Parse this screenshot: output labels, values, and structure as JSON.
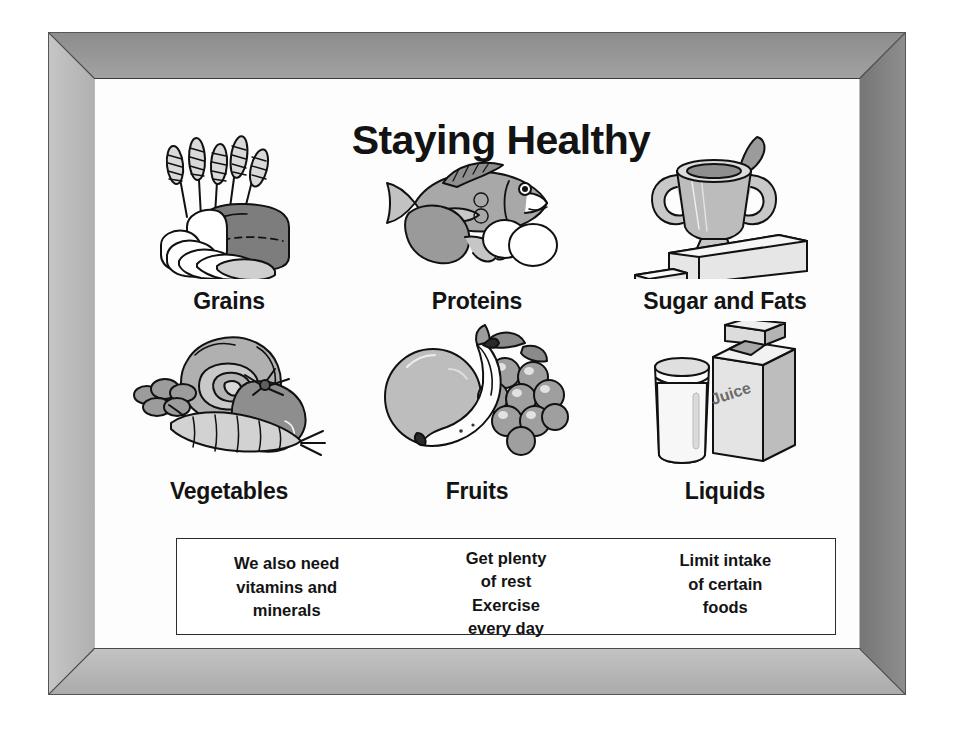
{
  "poster": {
    "title": "Staying Healthy",
    "frame_colors": {
      "frame_base": "#b9b9b9",
      "bevel_top": "#8c8c8c",
      "bevel_left": "#c6c6c6",
      "bevel_right": "#767676",
      "bevel_bottom": "#c3c3c3",
      "canvas": "#fdfdfd",
      "ink": "#131313"
    }
  },
  "food_groups": [
    {
      "id": "grains",
      "label": "Grains",
      "icon": "grains-bread-wheat-illustration",
      "items": [
        "wheat stalks",
        "loaf of bread",
        "bread slices"
      ]
    },
    {
      "id": "proteins",
      "label": "Proteins",
      "icon": "proteins-fish-meat-eggs-illustration",
      "items": [
        "fish",
        "chicken drumstick",
        "eggs"
      ]
    },
    {
      "id": "sugar-and-fats",
      "label": "Sugar and Fats",
      "icon": "sugar-bowl-butter-illustration",
      "items": [
        "sugar bowl with spoon",
        "stick of butter",
        "pat of butter"
      ]
    },
    {
      "id": "vegetables",
      "label": "Vegetables",
      "icon": "vegetables-lettuce-tomato-carrot-illustration",
      "items": [
        "lettuce",
        "tomato",
        "carrot",
        "broccoli"
      ]
    },
    {
      "id": "fruits",
      "label": "Fruits",
      "icon": "fruits-orange-banana-grapes-illustration",
      "items": [
        "orange",
        "banana",
        "grapes"
      ]
    },
    {
      "id": "liquids",
      "label": "Liquids",
      "icon": "liquids-milk-glass-juice-carton-illustration",
      "items": [
        "glass of milk",
        "juice carton"
      ],
      "carton_label": "Juice"
    }
  ],
  "advice": {
    "columns": [
      {
        "id": "vitamins",
        "lines": [
          "We also need",
          "vitamins and",
          "minerals"
        ]
      },
      {
        "id": "rest",
        "lines": [
          "Get plenty",
          "of rest"
        ]
      },
      {
        "id": "exercise",
        "lines": [
          "Exercise",
          "every day"
        ]
      },
      {
        "id": "limit",
        "lines": [
          "Limit intake",
          "of certain",
          "foods"
        ]
      }
    ]
  }
}
